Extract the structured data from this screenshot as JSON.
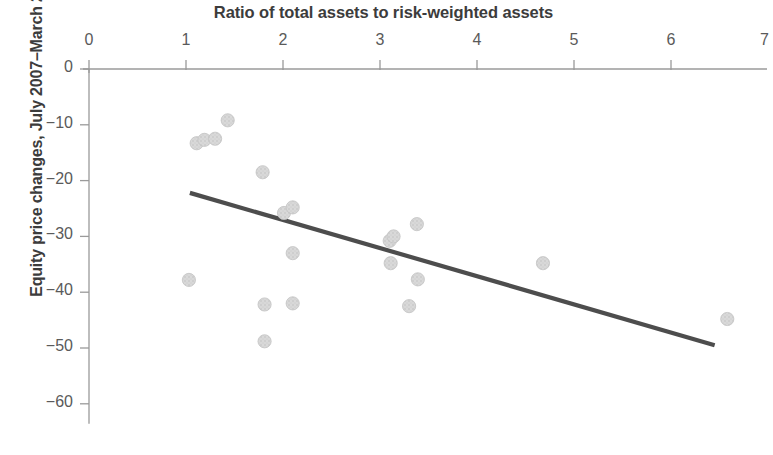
{
  "chart_data": {
    "type": "scatter",
    "title": "",
    "xlabel": "Ratio of total assets to risk-weighted assets",
    "ylabel": "Equity price changes, July 2007–March 2008",
    "xlim": [
      0,
      7
    ],
    "ylim": [
      -65,
      2
    ],
    "xticks": [
      0,
      1,
      2,
      3,
      4,
      5,
      6,
      7
    ],
    "xtick_labels": [
      "0",
      "1",
      "2",
      "3",
      "4",
      "5",
      "6",
      "7"
    ],
    "yticks": [
      0,
      -10,
      -20,
      -30,
      -40,
      -50,
      -60
    ],
    "ytick_labels": [
      "0",
      "−10",
      "−20",
      "−30",
      "−40",
      "−50",
      "−60"
    ],
    "grid": false,
    "legend": null,
    "marker_color": "#d8d8d8",
    "marker_edge_color": "#c3c3c3",
    "axis_color": "#9a9a9a",
    "trendline_color": "#4d4d4d",
    "points": [
      {
        "x": 1.11,
        "y": -13.3
      },
      {
        "x": 1.19,
        "y": -12.7
      },
      {
        "x": 1.3,
        "y": -12.5
      },
      {
        "x": 1.43,
        "y": -9.2
      },
      {
        "x": 1.79,
        "y": -18.5
      },
      {
        "x": 1.03,
        "y": -37.8
      },
      {
        "x": 1.81,
        "y": -48.8
      },
      {
        "x": 2.01,
        "y": -25.8
      },
      {
        "x": 2.1,
        "y": -24.8
      },
      {
        "x": 2.1,
        "y": -33.0
      },
      {
        "x": 2.1,
        "y": -42.0
      },
      {
        "x": 1.81,
        "y": -42.2
      },
      {
        "x": 3.1,
        "y": -30.8
      },
      {
        "x": 3.14,
        "y": -30.0
      },
      {
        "x": 3.11,
        "y": -34.8
      },
      {
        "x": 3.38,
        "y": -27.8
      },
      {
        "x": 3.39,
        "y": -37.7
      },
      {
        "x": 3.3,
        "y": -42.5
      },
      {
        "x": 4.68,
        "y": -34.8
      },
      {
        "x": 6.58,
        "y": -44.8
      }
    ],
    "trendline": {
      "type": "linear",
      "x_start": 1.04,
      "y_start": -22.2,
      "x_end": 6.45,
      "y_end": -49.5
    }
  }
}
